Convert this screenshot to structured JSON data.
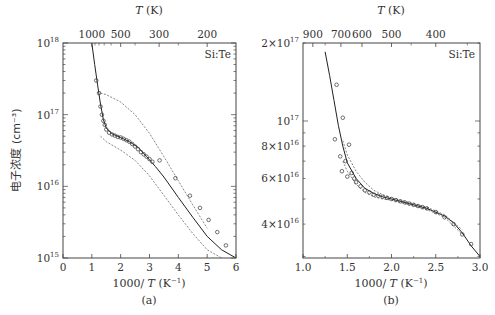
{
  "panels": [
    {
      "id": "a",
      "caption": "(a)",
      "label": "Si:Te",
      "top_axis_title": "T (K)",
      "top_ticks": [
        "1000",
        "500",
        "300",
        "200"
      ],
      "x_title": "1000/ T (K⁻¹)",
      "x_ticks": [
        "0",
        "1",
        "2",
        "3",
        "4",
        "5",
        "6"
      ],
      "y_title": "电子浓度 (cm⁻³)",
      "y_ticks": [
        "10^18",
        "10^17",
        "10^16",
        "10^15"
      ]
    },
    {
      "id": "b",
      "caption": "(b)",
      "label": "Si:Te",
      "top_axis_title": "T (K)",
      "top_ticks": [
        "900",
        "700",
        "600",
        "500",
        "400"
      ],
      "x_title": "1000/ T (K⁻¹)",
      "x_ticks": [
        "1.0",
        "1.5",
        "2.0",
        "2.5",
        "3.0"
      ],
      "y_ticks": [
        "2×10^17",
        "10^17",
        "8×10^16",
        "6×10^16",
        "4×10^16"
      ]
    }
  ],
  "chart_data": [
    {
      "type": "scatter",
      "title": "(a) Si:Te",
      "xlabel": "1000/T (K^-1)",
      "ylabel": "电子浓度 (cm^-3)",
      "top_xlabel": "T (K)",
      "xlim": [
        0,
        6
      ],
      "ylim": [
        1000000000000000.0,
        1e+18
      ],
      "yscale": "log",
      "grid": false,
      "legend": null,
      "annotations": [
        "Si:Te"
      ],
      "x_ticks": [
        0,
        1,
        2,
        3,
        4,
        5,
        6
      ],
      "top_ticks_T": [
        1000,
        500,
        300,
        200
      ],
      "series": [
        {
          "name": "fit (solid)",
          "style": "solid",
          "x": [
            1.0,
            1.1,
            1.2,
            1.3,
            1.4,
            1.5,
            1.7,
            2.0,
            2.3,
            2.6,
            2.9,
            3.2,
            3.5,
            4.0,
            4.5,
            5.0,
            5.5,
            6.0
          ],
          "y": [
            1e+18,
            5e+17,
            2.6e+17,
            1.4e+17,
            8.5e+16,
            6.5e+16,
            5.4e+16,
            4.8e+16,
            4.2e+16,
            3.5e+16,
            2.6e+16,
            1.9e+16,
            1.35e+16,
            7000000000000000.0,
            3700000000000000.0,
            2000000000000000.0,
            1300000000000000.0,
            1000000000000000.0
          ]
        },
        {
          "name": "upper bound (dashed)",
          "style": "dashed",
          "x": [
            1.3,
            1.5,
            2.0,
            2.5,
            3.0,
            3.5,
            4.0,
            4.5,
            5.0
          ],
          "y": [
            2e+17,
            1.9e+17,
            1.5e+17,
            1e+17,
            5.5e+16,
            2.6e+16,
            1.2e+16,
            5500000000000000.0,
            2600000000000000.0
          ]
        },
        {
          "name": "lower bound (dashed)",
          "style": "dashed",
          "x": [
            1.3,
            1.5,
            2.0,
            2.5,
            3.0,
            3.5,
            4.0,
            4.5,
            5.0,
            5.5
          ],
          "y": [
            5e+16,
            4.2e+16,
            3.2e+16,
            2.3e+16,
            1.4e+16,
            7500000000000000.0,
            4000000000000000.0,
            2200000000000000.0,
            1300000000000000.0,
            1000000000000000.0
          ]
        },
        {
          "name": "measured (circles)",
          "style": "markers",
          "x": [
            1.15,
            1.25,
            1.3,
            1.35,
            1.4,
            1.45,
            1.5,
            1.6,
            1.7,
            1.8,
            1.9,
            2.0,
            2.1,
            2.2,
            2.3,
            2.4,
            2.5,
            2.6,
            2.7,
            2.8,
            2.9,
            3.0,
            3.1,
            3.35,
            3.9,
            4.4,
            4.75,
            5.05,
            5.35,
            5.65
          ],
          "y": [
            3e+17,
            2e+17,
            1.3e+17,
            1e+17,
            8.2e+16,
            7.2e+16,
            6.2e+16,
            5.6e+16,
            5.3e+16,
            5.1e+16,
            4.9e+16,
            4.8e+16,
            4.6e+16,
            4.4e+16,
            4.2e+16,
            3.9e+16,
            3.6e+16,
            3.3e+16,
            3e+16,
            2.8e+16,
            2.6e+16,
            2.4e+16,
            2.2e+16,
            2.3e+16,
            1.3e+16,
            7400000000000000.0,
            5000000000000000.0,
            3400000000000000.0,
            2300000000000000.0,
            1500000000000000.0
          ]
        }
      ]
    },
    {
      "type": "scatter",
      "title": "(b) Si:Te",
      "xlabel": "1000/T (K^-1)",
      "ylabel": "电子浓度 (cm^-3)",
      "top_xlabel": "T (K)",
      "xlim": [
        1.0,
        3.0
      ],
      "ylim": [
        2.96e+16,
        2e+17
      ],
      "yscale": "log",
      "grid": false,
      "legend": null,
      "annotations": [
        "Si:Te"
      ],
      "x_ticks": [
        1.0,
        1.5,
        2.0,
        2.5,
        3.0
      ],
      "top_ticks_T": [
        900,
        700,
        600,
        500,
        400
      ],
      "series": [
        {
          "name": "fit (solid)",
          "style": "solid",
          "x": [
            1.25,
            1.3,
            1.35,
            1.4,
            1.45,
            1.5,
            1.6,
            1.7,
            1.8,
            1.9,
            2.0,
            2.2,
            2.4,
            2.6,
            2.7,
            2.8,
            2.9,
            3.0
          ],
          "y": [
            1.85e+17,
            1.5e+17,
            1.2e+17,
            9.6e+16,
            8e+16,
            6.9e+16,
            6e+16,
            5.5e+16,
            5.25e+16,
            5.1e+16,
            5e+16,
            4.8e+16,
            4.6e+16,
            4.3e+16,
            4.05e+16,
            3.7e+16,
            3.3e+16,
            3e+16
          ]
        },
        {
          "name": "upper bound (dashed)",
          "style": "dashed",
          "x": [
            1.45,
            1.5,
            1.6,
            1.7,
            1.8,
            1.9,
            2.0,
            2.2,
            2.4,
            2.6,
            2.8
          ],
          "y": [
            8.4e+16,
            7.4e+16,
            6.4e+16,
            5.8e+16,
            5.4e+16,
            5.2e+16,
            5.05e+16,
            4.85e+16,
            4.65e+16,
            4.35e+16,
            3.8e+16
          ]
        },
        {
          "name": "lower bound (dashed)",
          "style": "dashed",
          "x": [
            1.45,
            1.5,
            1.6,
            1.7,
            1.8,
            1.9,
            2.0,
            2.2,
            2.4,
            2.6,
            2.8
          ],
          "y": [
            7e+16,
            6.4e+16,
            5.7e+16,
            5.3e+16,
            5.1e+16,
            5e+16,
            4.95e+16,
            4.75e+16,
            4.55e+16,
            4.25e+16,
            3.65e+16
          ]
        },
        {
          "name": "measured (circles)",
          "style": "markers",
          "x": [
            1.38,
            1.45,
            1.36,
            1.52,
            1.42,
            1.48,
            1.44,
            1.55,
            1.5,
            1.58,
            1.6,
            1.65,
            1.7,
            1.75,
            1.8,
            1.85,
            1.9,
            1.95,
            2.0,
            2.05,
            2.1,
            2.15,
            2.2,
            2.25,
            2.3,
            2.35,
            2.4,
            2.5,
            2.6,
            2.7,
            2.8,
            2.9
          ],
          "y": [
            1.38e+17,
            1.03e+17,
            8.5e+16,
            8.1e+16,
            7.3e+16,
            7e+16,
            6.4e+16,
            6.3e+16,
            6.1e+16,
            6e+16,
            5.8e+16,
            5.6e+16,
            5.4e+16,
            5.3e+16,
            5.2e+16,
            5.15e+16,
            5.1e+16,
            5.05e+16,
            5e+16,
            4.95e+16,
            4.9e+16,
            4.85e+16,
            4.8e+16,
            4.75e+16,
            4.7e+16,
            4.65e+16,
            4.6e+16,
            4.45e+16,
            4.25e+16,
            4e+16,
            3.65e+16,
            3.35e+16
          ]
        }
      ]
    }
  ]
}
